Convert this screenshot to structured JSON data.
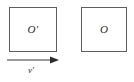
{
  "figure": {
    "type": "physics-reference-frame-diagram",
    "background_color": "#ffffff",
    "stroke_color": "#5d5d5d",
    "text_color": "#2b2b2b"
  },
  "boxes": [
    {
      "id": "primed-frame",
      "label": "O′",
      "position": "left",
      "x": 9,
      "y": 7,
      "width": 48,
      "height": 45
    },
    {
      "id": "unprimed-frame",
      "label": "O",
      "position": "right",
      "x": 81,
      "y": 7,
      "width": 46,
      "height": 45
    }
  ],
  "arrow": {
    "name": "velocity-arrow",
    "label": "v′",
    "direction": "right",
    "x_start": 6,
    "x_end": 58,
    "y": 60
  }
}
